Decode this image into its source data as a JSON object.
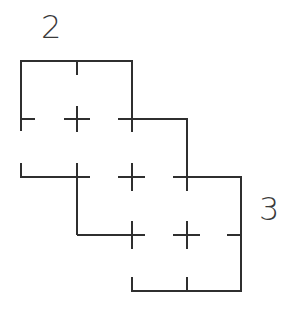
{
  "diagram": {
    "labels": [
      {
        "id": "label-2",
        "text": "2",
        "x": 41,
        "y": 11
      },
      {
        "id": "label-3",
        "text": "3",
        "x": 259,
        "y": 193
      }
    ],
    "colors": {
      "stroke": "#2f2f2f",
      "background": "#ffffff"
    },
    "grid": {
      "columns_x": [
        21,
        77,
        132,
        187,
        241
      ],
      "rows_y": [
        61,
        119,
        177,
        235,
        291
      ]
    }
  }
}
